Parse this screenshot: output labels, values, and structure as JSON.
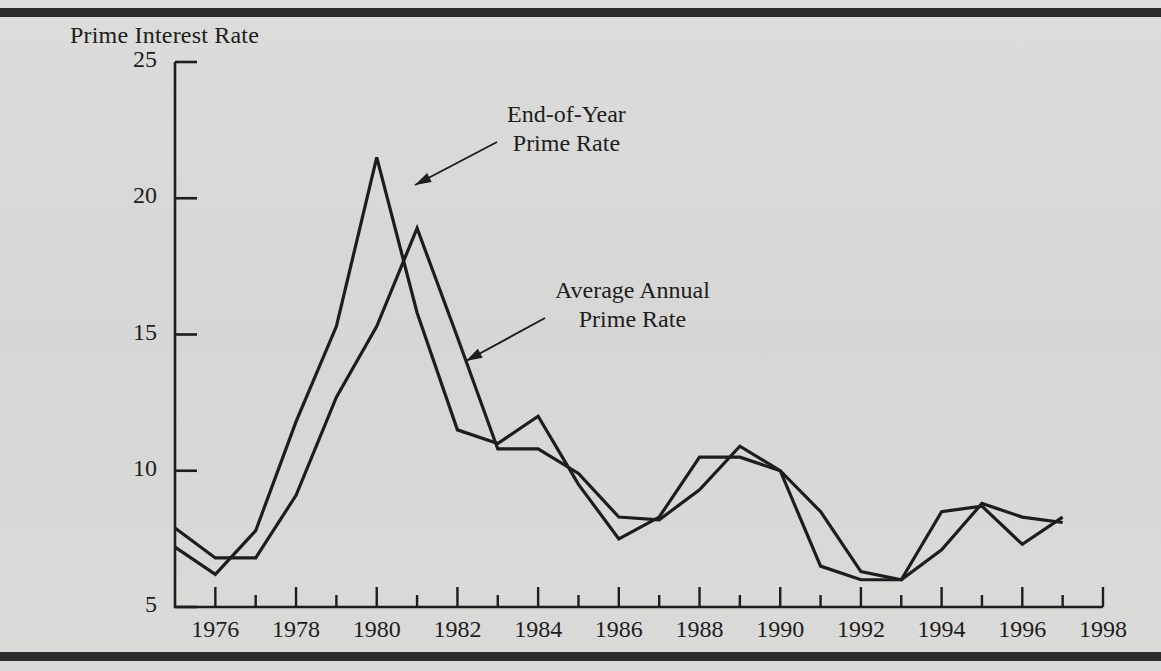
{
  "figure": {
    "y_axis_title": "Prime Interest Rate",
    "background_color": "#d8d8d6",
    "ink_color": "#1d1d1d",
    "rule_color": "#2b2b2b"
  },
  "annotations": [
    {
      "name": "end-of-year",
      "line1": "End-of-Year",
      "line2": "Prime Rate"
    },
    {
      "name": "average-annual",
      "line1": "Average Annual",
      "line2": "Prime Rate"
    }
  ],
  "chart_data": {
    "type": "line",
    "title": "",
    "xlabel": "",
    "ylabel": "Prime Interest Rate",
    "xlim": [
      1975,
      1998
    ],
    "ylim": [
      5,
      25
    ],
    "yticks": [
      5,
      10,
      15,
      20,
      25
    ],
    "xticks": [
      1976,
      1978,
      1980,
      1982,
      1984,
      1986,
      1988,
      1990,
      1992,
      1994,
      1996,
      1998
    ],
    "xticks_minor_every": 1,
    "grid": false,
    "legend": "annotations-with-arrows",
    "x": [
      1975,
      1976,
      1977,
      1978,
      1979,
      1980,
      1981,
      1982,
      1983,
      1984,
      1985,
      1986,
      1987,
      1988,
      1989,
      1990,
      1991,
      1992,
      1993,
      1994,
      1995,
      1996,
      1997
    ],
    "series": [
      {
        "name": "End-of-Year Prime Rate",
        "values": [
          7.2,
          6.2,
          7.8,
          11.8,
          15.3,
          21.5,
          15.8,
          11.5,
          11.0,
          12.0,
          9.5,
          7.5,
          8.3,
          10.5,
          10.5,
          10.0,
          6.5,
          6.0,
          6.0,
          8.5,
          8.7,
          7.3,
          8.3
        ]
      },
      {
        "name": "Average Annual Prime Rate",
        "values": [
          7.9,
          6.8,
          6.8,
          9.1,
          12.7,
          15.3,
          18.9,
          14.9,
          10.8,
          10.8,
          9.9,
          8.3,
          8.2,
          9.3,
          10.9,
          10.0,
          8.5,
          6.3,
          6.0,
          7.1,
          8.8,
          8.3,
          8.1
        ]
      }
    ]
  }
}
